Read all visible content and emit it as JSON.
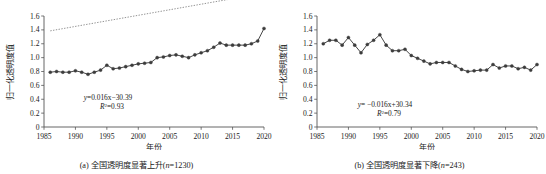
{
  "figure": {
    "background": "#ffffff",
    "panel_count": 2
  },
  "chart_data": [
    {
      "type": "line",
      "id": "panel-a",
      "title": "",
      "caption": "(a) 全国透明度显著上升(n=1230)",
      "caption_prefix": "(a) 全国透明度显著上升(",
      "caption_n_symbol": "n",
      "caption_suffix": "=1230)",
      "xlabel": "年份",
      "ylabel": "归一化透明度值",
      "xlim": [
        1985,
        2020
      ],
      "ylim": [
        0,
        1.6
      ],
      "xticks": [
        1985,
        1990,
        1995,
        2000,
        2005,
        2010,
        2015,
        2020
      ],
      "xtick_labels": [
        "1985",
        "1990",
        "1995",
        "2000",
        "2005",
        "2010",
        "2015",
        "2020"
      ],
      "yticks": [
        0,
        0.2,
        0.4,
        0.6,
        0.8,
        1.0,
        1.2,
        1.4,
        1.6
      ],
      "ytick_labels": [
        "0",
        "0.2",
        "0.4",
        "0.6",
        "0.8",
        "1.0",
        "1.2",
        "1.4",
        "1.6"
      ],
      "grid": false,
      "legend": "none",
      "marker": "circle",
      "series_color": "#3c3c3c",
      "trend_color": "#808080",
      "trend_style": "dotted",
      "annotation_equation": "y=0.016x−30.39",
      "annotation_equation_lhs": "y",
      "annotation_equation_rhs": "=0.016x−30.39",
      "annotation_r2_symbol": "R",
      "annotation_r2_sup": "2",
      "annotation_r2_value": "=0.93",
      "annotation_r2": "R²=0.93",
      "trend_slope": 0.016,
      "trend_intercept": -30.39,
      "r_squared": 0.93,
      "n": 1230,
      "x": [
        1986,
        1987,
        1988,
        1989,
        1990,
        1991,
        1992,
        1993,
        1994,
        1995,
        1996,
        1997,
        1998,
        1999,
        2000,
        2001,
        2002,
        2003,
        2004,
        2005,
        2006,
        2007,
        2008,
        2009,
        2010,
        2011,
        2012,
        2013,
        2014,
        2015,
        2016,
        2017,
        2018,
        2019,
        2020
      ],
      "values": [
        0.79,
        0.8,
        0.79,
        0.79,
        0.81,
        0.79,
        0.76,
        0.79,
        0.82,
        0.89,
        0.84,
        0.85,
        0.87,
        0.89,
        0.91,
        0.92,
        0.93,
        1.0,
        1.01,
        1.03,
        1.04,
        1.02,
        1.0,
        1.04,
        1.07,
        1.1,
        1.15,
        1.21,
        1.18,
        1.18,
        1.18,
        1.18,
        1.2,
        1.24,
        1.42
      ]
    },
    {
      "type": "line",
      "id": "panel-b",
      "title": "",
      "caption": "(b) 全国透明度显著下降(n=243)",
      "caption_prefix": "(b) 全国透明度显著下降(",
      "caption_n_symbol": "n",
      "caption_suffix": "=243)",
      "xlabel": "年份",
      "ylabel": "归一化透明度值",
      "xlim": [
        1985,
        2020
      ],
      "ylim": [
        0,
        1.6
      ],
      "xticks": [
        1985,
        1990,
        1995,
        2000,
        2005,
        2010,
        2015,
        2020
      ],
      "xtick_labels": [
        "1985",
        "1990",
        "1995",
        "2000",
        "2005",
        "2010",
        "2015",
        "2020"
      ],
      "yticks": [
        0,
        0.2,
        0.4,
        0.6,
        0.8,
        1.0,
        1.2,
        1.4,
        1.6
      ],
      "ytick_labels": [
        "0",
        "0.2",
        "0.4",
        "0.6",
        "0.8",
        "1.0",
        "1.2",
        "1.4",
        "1.6"
      ],
      "grid": false,
      "legend": "none",
      "marker": "circle",
      "series_color": "#3c3c3c",
      "trend_color": "#808080",
      "trend_style": "dotted",
      "annotation_equation": "y= −0.016x+30.34",
      "annotation_equation_lhs": "y",
      "annotation_equation_rhs": "= −0.016x+30.34",
      "annotation_r2_symbol": "R",
      "annotation_r2_sup": "2",
      "annotation_r2_value": "=0.79",
      "annotation_r2": "R²=0.79",
      "trend_slope": -0.016,
      "trend_intercept": 30.34,
      "r_squared": 0.79,
      "n": 243,
      "x": [
        1986,
        1987,
        1988,
        1989,
        1990,
        1991,
        1992,
        1993,
        1994,
        1995,
        1996,
        1997,
        1998,
        1999,
        2000,
        2001,
        2002,
        2003,
        2004,
        2005,
        2006,
        2007,
        2008,
        2009,
        2010,
        2011,
        2012,
        2013,
        2014,
        2015,
        2016,
        2017,
        2018,
        2019,
        2020
      ],
      "values": [
        1.2,
        1.25,
        1.25,
        1.18,
        1.29,
        1.18,
        1.07,
        1.19,
        1.25,
        1.33,
        1.18,
        1.1,
        1.1,
        1.12,
        1.03,
        0.99,
        0.95,
        0.91,
        0.93,
        0.93,
        0.93,
        0.88,
        0.83,
        0.8,
        0.81,
        0.82,
        0.82,
        0.9,
        0.85,
        0.88,
        0.88,
        0.84,
        0.86,
        0.82,
        0.9
      ]
    }
  ]
}
